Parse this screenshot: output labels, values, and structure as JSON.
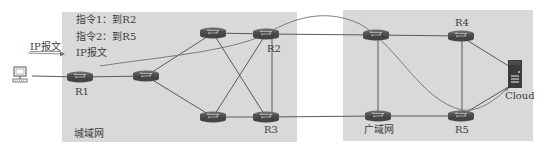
{
  "diagram": {
    "regions": [
      {
        "id": "metro",
        "label": "城域网"
      },
      {
        "id": "wan",
        "label": "广域网"
      }
    ],
    "annotations": {
      "instruction1": "指令1：到R2",
      "instruction2": "指令2：到R5",
      "ip_packet_inner": "IP报文",
      "ip_packet_outer": "IP报文"
    },
    "nodes": [
      {
        "id": "pc",
        "type": "computer",
        "label": ""
      },
      {
        "id": "R1",
        "type": "router",
        "label": "R1"
      },
      {
        "id": "MA",
        "type": "router",
        "label": ""
      },
      {
        "id": "MB",
        "type": "router",
        "label": ""
      },
      {
        "id": "R2",
        "type": "router",
        "label": "R2"
      },
      {
        "id": "MC",
        "type": "router",
        "label": ""
      },
      {
        "id": "R3",
        "type": "router",
        "label": "R3"
      },
      {
        "id": "WA",
        "type": "router",
        "label": ""
      },
      {
        "id": "R4",
        "type": "router",
        "label": "R4"
      },
      {
        "id": "WB",
        "type": "router",
        "label": ""
      },
      {
        "id": "R5",
        "type": "router",
        "label": "R5"
      },
      {
        "id": "cloud",
        "type": "server",
        "label": "Cloud"
      }
    ],
    "edges": [
      [
        "pc",
        "R1"
      ],
      [
        "R1",
        "MA"
      ],
      [
        "MA",
        "MB"
      ],
      [
        "MA",
        "MC"
      ],
      [
        "MB",
        "R2"
      ],
      [
        "MB",
        "R3"
      ],
      [
        "MC",
        "R2"
      ],
      [
        "MC",
        "R3"
      ],
      [
        "R2",
        "R3"
      ],
      [
        "R2",
        "WA"
      ],
      [
        "R3",
        "WB"
      ],
      [
        "WA",
        "R4"
      ],
      [
        "WA",
        "WB"
      ],
      [
        "WB",
        "R5"
      ],
      [
        "R4",
        "R5"
      ],
      [
        "R4",
        "cloud"
      ],
      [
        "R5",
        "cloud"
      ]
    ],
    "path": {
      "description": "IP packet route",
      "hops": [
        "R1",
        "R2",
        "R5",
        "cloud"
      ]
    },
    "colors": {
      "panel": "#d9d9d9",
      "link": "#4a4a4a",
      "router_body": "#5a5a5a",
      "path": "#707070"
    }
  }
}
